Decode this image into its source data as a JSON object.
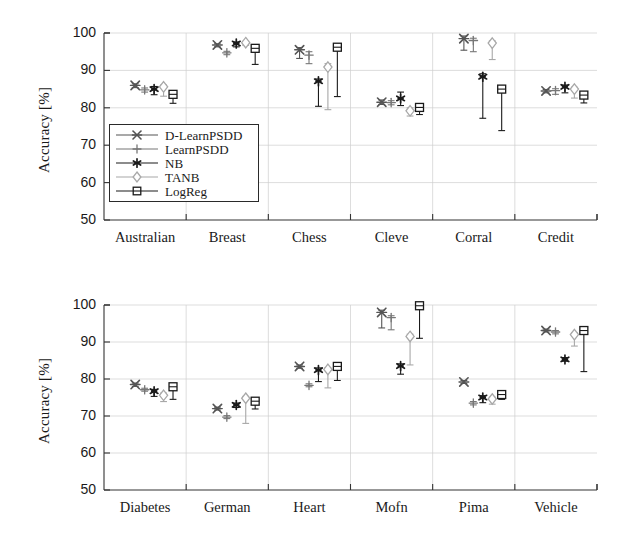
{
  "figure": {
    "background": "#ffffff",
    "panel_count": 2
  },
  "legend": {
    "position": "inside-top-panel-lower-left",
    "entries": [
      {
        "label": "D-LearnPSDD",
        "marker": "cross-star",
        "color": "#555555"
      },
      {
        "label": "LearnPSDD",
        "marker": "plus",
        "color": "#777777"
      },
      {
        "label": "NB",
        "marker": "asterisk",
        "color": "#1a1a1a"
      },
      {
        "label": "TANB",
        "marker": "diamond",
        "color": "#a8a8a8"
      },
      {
        "label": "LogReg",
        "marker": "square",
        "color": "#1a1a1a"
      }
    ]
  },
  "chart_data": [
    {
      "type": "scatter",
      "id": "top-panel",
      "title": "",
      "xlabel": "",
      "ylabel": "Accuracy [%]",
      "ylim": [
        50,
        100
      ],
      "yticks": [
        50,
        60,
        70,
        80,
        90,
        100
      ],
      "ytick_labels": [
        "50",
        "60",
        "70",
        "80",
        "90",
        "100"
      ],
      "grid": true,
      "error_bars": true,
      "categories": [
        "Australian",
        "Breast",
        "Chess",
        "Cleve",
        "Corral",
        "Credit"
      ],
      "series": [
        {
          "name": "D-LearnPSDD",
          "marker": "cross-star",
          "color": "#555555",
          "values": [
            86.0,
            96.8,
            95.5,
            81.5,
            98.5,
            84.5
          ],
          "err_low": [
            85.4,
            96.3,
            93.2,
            80.9,
            95.4,
            84.0
          ],
          "err_high": [
            86.4,
            97.1,
            96.1,
            82.1,
            99.2,
            84.9
          ]
        },
        {
          "name": "LearnPSDD",
          "marker": "plus",
          "color": "#777777",
          "values": [
            84.8,
            94.7,
            94.1,
            81.4,
            98.0,
            84.6
          ],
          "err_low": [
            84.2,
            94.2,
            91.8,
            80.8,
            95.0,
            83.6
          ],
          "err_high": [
            85.3,
            95.1,
            95.0,
            81.9,
            98.6,
            85.1
          ]
        },
        {
          "name": "NB",
          "marker": "asterisk",
          "color": "#1a1a1a",
          "values": [
            85.0,
            97.2,
            87.1,
            82.5,
            88.3,
            85.6
          ],
          "err_low": [
            83.5,
            96.3,
            80.4,
            80.6,
            77.2,
            84.0
          ],
          "err_high": [
            85.7,
            97.6,
            87.7,
            84.2,
            89.1,
            86.1
          ]
        },
        {
          "name": "TANB",
          "marker": "diamond",
          "color": "#a8a8a8",
          "values": [
            85.6,
            97.4,
            90.9,
            79.2,
            97.3,
            85.0
          ],
          "err_low": [
            83.1,
            96.7,
            79.5,
            77.8,
            92.9,
            82.6
          ],
          "err_high": [
            86.1,
            97.8,
            91.8,
            80.0,
            97.9,
            85.5
          ]
        },
        {
          "name": "LogReg",
          "marker": "square",
          "color": "#1a1a1a",
          "values": [
            83.6,
            95.9,
            96.2,
            80.1,
            85.0,
            83.4
          ],
          "err_low": [
            81.2,
            91.6,
            83.0,
            78.2,
            73.9,
            81.3
          ],
          "err_high": [
            84.4,
            96.3,
            96.5,
            80.9,
            85.6,
            84.1
          ]
        }
      ]
    },
    {
      "type": "scatter",
      "id": "bottom-panel",
      "title": "",
      "xlabel": "",
      "ylabel": "Accuracy [%]",
      "ylim": [
        50,
        100
      ],
      "yticks": [
        50,
        60,
        70,
        80,
        90,
        100
      ],
      "ytick_labels": [
        "50",
        "60",
        "70",
        "80",
        "90",
        "100"
      ],
      "grid": true,
      "error_bars": true,
      "categories": [
        "Diabetes",
        "German",
        "Heart",
        "Mofn",
        "Pima",
        "Vehicle"
      ],
      "series": [
        {
          "name": "D-LearnPSDD",
          "marker": "cross-star",
          "color": "#555555",
          "values": [
            78.5,
            72.0,
            83.4,
            98.0,
            79.2,
            93.1
          ],
          "err_low": [
            78.0,
            71.6,
            82.9,
            93.8,
            78.8,
            92.7
          ],
          "err_high": [
            78.9,
            72.4,
            83.8,
            98.6,
            79.6,
            93.5
          ]
        },
        {
          "name": "LearnPSDD",
          "marker": "plus",
          "color": "#777777",
          "values": [
            77.1,
            69.7,
            78.3,
            96.6,
            73.5,
            92.7
          ],
          "err_low": [
            76.7,
            69.3,
            77.9,
            93.3,
            73.0,
            92.2
          ],
          "err_high": [
            77.5,
            70.1,
            78.7,
            97.1,
            73.9,
            93.1
          ]
        },
        {
          "name": "NB",
          "marker": "asterisk",
          "color": "#1a1a1a",
          "values": [
            76.7,
            73.0,
            82.4,
            83.5,
            75.0,
            85.3
          ],
          "err_low": [
            75.3,
            72.3,
            79.3,
            81.3,
            73.6,
            84.8
          ],
          "err_high": [
            77.2,
            73.5,
            83.0,
            84.1,
            75.5,
            85.8
          ]
        },
        {
          "name": "TANB",
          "marker": "diamond",
          "color": "#a8a8a8",
          "values": [
            75.6,
            74.8,
            82.6,
            91.5,
            74.6,
            92.0
          ],
          "err_low": [
            73.9,
            68.0,
            77.6,
            83.8,
            73.2,
            88.9
          ],
          "err_high": [
            76.2,
            75.3,
            83.1,
            92.1,
            75.1,
            92.5
          ]
        },
        {
          "name": "LogReg",
          "marker": "square",
          "color": "#1a1a1a",
          "values": [
            77.9,
            74.0,
            83.4,
            99.8,
            75.8,
            93.1
          ],
          "err_low": [
            74.5,
            71.9,
            79.6,
            91.0,
            74.5,
            82.0
          ],
          "err_high": [
            78.4,
            74.5,
            83.9,
            99.9,
            76.3,
            93.6
          ]
        }
      ]
    }
  ]
}
